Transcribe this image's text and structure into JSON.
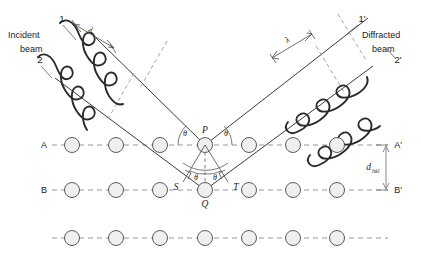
{
  "figure": {
    "background_color": "#ffffff"
  },
  "labels": {
    "incident_beam_line1": "Incident",
    "incident_beam_line2": "beam",
    "incident_ray_1": "1",
    "incident_ray_2": "2",
    "diffracted_beam_line1": "Diffracted",
    "diffracted_beam_line2": "beam",
    "diffracted_ray_1": "1'",
    "diffracted_ray_2": "2'",
    "wavelength_left": "λ",
    "wavelength_right": "λ",
    "plane_a_left": "A",
    "plane_a_right": "A'",
    "plane_b_left": "B",
    "plane_b_right": "B'",
    "point_p": "P",
    "point_q": "Q",
    "point_s": "S",
    "point_t": "T",
    "theta_upper_left": "θ",
    "theta_upper_right": "θ",
    "theta_lower_left": "θ",
    "theta_lower_right": "θ",
    "spacing_symbol": "d",
    "spacing_subscript": "hkl"
  },
  "geometry": {
    "plane_a_y": 145,
    "plane_b_y": 190,
    "plane_c_y": 238,
    "point_p": {
      "x": 205,
      "y": 145
    },
    "point_q": {
      "x": 205,
      "y": 190
    },
    "point_s": {
      "x": 183,
      "y": 182
    },
    "point_t": {
      "x": 228,
      "y": 182
    },
    "atom_radius": 7.5,
    "atoms_per_row": 7,
    "atom_x_positions": [
      72,
      116,
      160,
      205,
      249,
      293,
      337
    ],
    "bragg_angle_label": "θ",
    "interplanar_spacing_label": "d_hkl"
  },
  "colors": {
    "atom_fill": "#efefef",
    "atom_stroke": "#4a4a4a",
    "plane_dash": "#8a8a8a",
    "ray": "#3a3a3a",
    "wave": "#2b2b2b",
    "text": "#1a1a1a"
  }
}
